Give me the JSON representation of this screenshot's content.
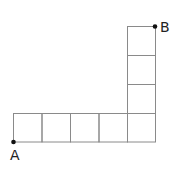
{
  "diagram": {
    "points": [
      {
        "label": "A",
        "x": 13,
        "y": 142
      },
      {
        "label": "B",
        "x": 155,
        "y": 26
      }
    ],
    "grid": {
      "cell": 28.5,
      "bottom_row": {
        "x0": 13,
        "y0": 113,
        "cols": 5
      },
      "right_column": {
        "x0": 127,
        "y0": 26,
        "rows": 4
      },
      "line_color": "#888888"
    }
  }
}
